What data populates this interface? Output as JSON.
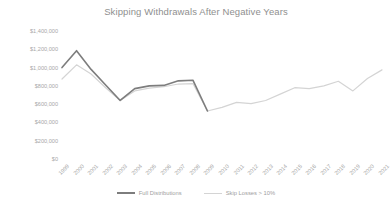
{
  "chart_data": {
    "type": "line",
    "title": "Skipping Withdrawals After Negative Years",
    "xlabel": "",
    "ylabel": "",
    "grid": false,
    "legend_position": "bottom",
    "ylim": [
      0,
      1400000
    ],
    "ytick_labels": [
      "$1,400,000",
      "$1,200,000",
      "$1,000,000",
      "$800,000",
      "$600,000",
      "$400,000",
      "$200,000",
      "$0"
    ],
    "ytick_values": [
      1400000,
      1200000,
      1000000,
      800000,
      600000,
      400000,
      200000,
      0
    ],
    "categories": [
      "1999",
      "2000",
      "2001",
      "2002",
      "2003",
      "2004",
      "2005",
      "2006",
      "2007",
      "2008",
      "2009",
      "2010",
      "2011",
      "2012",
      "2013",
      "2014",
      "2015",
      "2016",
      "2017",
      "2018",
      "2019",
      "2020",
      "2021"
    ],
    "series": [
      {
        "name": "Full Distributions",
        "color": "#7d7d7d",
        "values": [
          1000000,
          1185000,
          980000,
          810000,
          640000,
          770000,
          800000,
          805000,
          855000,
          862000,
          525000,
          null,
          null,
          null,
          null,
          null,
          null,
          null,
          null,
          null,
          null,
          null,
          null
        ]
      },
      {
        "name": "Skip Losses > 10%",
        "color": "#d4d4d4",
        "values": [
          875000,
          1030000,
          930000,
          780000,
          640000,
          745000,
          775000,
          790000,
          820000,
          825000,
          525000,
          565000,
          620000,
          605000,
          640000,
          710000,
          780000,
          770000,
          800000,
          850000,
          745000,
          880000,
          975000
        ]
      }
    ]
  },
  "title": {
    "text": "Skipping Withdrawals After Negative Years"
  },
  "legend": {
    "items": [
      {
        "label": "Full Distributions"
      },
      {
        "label": "Skip Losses > 10%"
      }
    ]
  }
}
